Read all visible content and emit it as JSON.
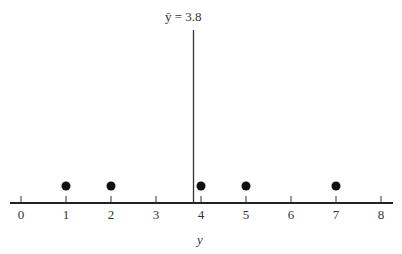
{
  "chart_data": {
    "type": "scatter",
    "title": "",
    "xlabel": "y",
    "ylabel": "",
    "xlim": [
      0,
      8
    ],
    "ticks": [
      0,
      1,
      2,
      3,
      4,
      5,
      6,
      7,
      8
    ],
    "tick_labels": [
      "0",
      "1",
      "2",
      "3",
      "4",
      "5",
      "6",
      "7",
      "8"
    ],
    "points": [
      1,
      2,
      4,
      5,
      7
    ],
    "mean": 3.8,
    "mean_annotation": "ȳ = 3.8",
    "grid": false,
    "legend": null
  },
  "axis": {
    "xlabel": "y",
    "tick_labels": [
      "0",
      "1",
      "2",
      "3",
      "4",
      "5",
      "6",
      "7",
      "8"
    ]
  },
  "annotation": {
    "mean_label": "ȳ = 3.8"
  }
}
